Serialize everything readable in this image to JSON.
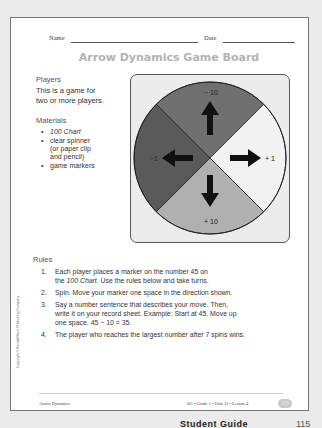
{
  "header": {
    "name_label": "Name",
    "date_label": "Date"
  },
  "title": "Arrow Dynamics Game Board",
  "players": {
    "heading": "Players",
    "text_line1": "This is a game for",
    "text_line2": "two or more players."
  },
  "materials": {
    "heading": "Materials",
    "items": [
      {
        "line1": "100 Chart",
        "italic": true
      },
      {
        "line1": "clear spinner",
        "line2": "(or paper clip",
        "line3": "and pencil)"
      },
      {
        "line1": "game markers"
      }
    ]
  },
  "spinner": {
    "sections": [
      {
        "label": "− 10",
        "direction": "up",
        "color": "#707070"
      },
      {
        "label": "+ 1",
        "direction": "right",
        "color": "#f2f2f2"
      },
      {
        "label": "+ 10",
        "direction": "down",
        "color": "#b0b0b0"
      },
      {
        "label": "−1",
        "direction": "left",
        "color": "#5a5a5a"
      }
    ],
    "box_color": "#ececec"
  },
  "rules": {
    "heading": "Rules",
    "items": [
      {
        "num": "1.",
        "line1": "Each player places a marker on the number 45 on",
        "line2_pre": "the ",
        "line2_italic": "100 Chart",
        "line2_post": ". Use the rules below and take turns."
      },
      {
        "num": "2.",
        "line1": "Spin. Move your marker one space in the direction shown."
      },
      {
        "num": "3.",
        "line1": "Say a number sentence that describes your move. Then,",
        "line2": "write it on your record sheet. Example: Start at 45. Move up",
        "line3": "one space. 45 − 10 = 35."
      },
      {
        "num": "4.",
        "line1": "The player who reaches the largest number after 7 spins wins."
      }
    ]
  },
  "copyright": "Copyright © Kendall/Hunt Publishing Company",
  "footer": {
    "left": "Arrow Dynamics",
    "right": "SG • Grade 1 • Unit 11 • Lesson 4",
    "page": "115"
  },
  "bottom": {
    "guide": "Student Guide",
    "page": "115"
  }
}
